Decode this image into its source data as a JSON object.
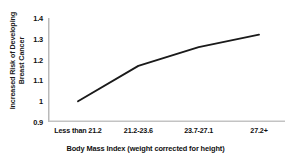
{
  "chart_data": {
    "type": "line",
    "title": "",
    "xlabel": "Body Mass Index (weight corrected for height)",
    "ylabel_line1": "Increased Risk of Developing",
    "ylabel_line2": "Breast Cancer",
    "categories": [
      "Less than 21.2",
      "21.2-23.6",
      "23.7-27.1",
      "27.2+"
    ],
    "values": [
      1.0,
      1.17,
      1.26,
      1.32
    ],
    "ylim": [
      0.9,
      1.4
    ],
    "yticks": [
      "1.4",
      "1.3",
      "1.2",
      "1.1",
      "1",
      "0.9"
    ],
    "ytick_values": [
      1.4,
      1.3,
      1.2,
      1.1,
      1.0,
      0.9
    ],
    "grid": false,
    "legend": false,
    "line_color": "#1a1a1a",
    "axis_color": "#b9b9b9"
  }
}
